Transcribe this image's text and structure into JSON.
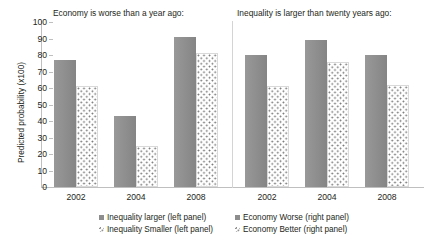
{
  "chart_data": {
    "type": "bar",
    "title": "",
    "xlabel": "",
    "ylabel": "Predicted probability (x100)",
    "ylim": [
      0,
      100
    ],
    "ytick_step": 10,
    "yticks": [
      100,
      90,
      80,
      70,
      60,
      50,
      40,
      30,
      20,
      10,
      0
    ],
    "grid": false,
    "legend_position": "bottom",
    "categories": [
      "2002",
      "2004",
      "2008"
    ],
    "panels": [
      {
        "title": "Economy is worse than a year ago:",
        "categories": [
          "2002",
          "2004",
          "2008"
        ],
        "series": [
          {
            "name": "Inequality larger (left panel)",
            "style": "solid",
            "color": "#8d8d8d",
            "values": [
              77,
              43,
              91
            ]
          },
          {
            "name": "Inequality Smaller (left panel)",
            "style": "dotted",
            "color": "#6f6f6f",
            "values": [
              61,
              25,
              81
            ]
          }
        ]
      },
      {
        "title": "Inequality is larger than twenty years ago:",
        "categories": [
          "2002",
          "2004",
          "2008"
        ],
        "series": [
          {
            "name": "Economy Worse (right panel)",
            "style": "solid",
            "color": "#8d8d8d",
            "values": [
              80,
              89,
              80
            ]
          },
          {
            "name": "Economy Better (right panel)",
            "style": "dotted",
            "color": "#6f6f6f",
            "values": [
              61,
              76,
              62
            ]
          }
        ]
      }
    ]
  },
  "axis": {
    "ylabel": "Predicted probability (x100)",
    "yticks": [
      "100",
      "90",
      "80",
      "70",
      "60",
      "50",
      "40",
      "30",
      "20",
      "10",
      "0"
    ],
    "xticks_left": [
      "2002",
      "2004",
      "2008"
    ],
    "xticks_right": [
      "2002",
      "2004",
      "2008"
    ]
  },
  "panels": {
    "left_title": "Economy is worse than a year ago:",
    "right_title": "Inequality is larger than twenty years ago:"
  },
  "legend": {
    "column1": [
      {
        "label": "Inequality larger (left panel)",
        "style": "solid"
      },
      {
        "label": "Inequality Smaller (left panel)",
        "style": "dotted"
      }
    ],
    "column2": [
      {
        "label": "Economy Worse (right panel)",
        "style": "solid"
      },
      {
        "label": "Economy Better (right panel)",
        "style": "dotted"
      }
    ]
  }
}
